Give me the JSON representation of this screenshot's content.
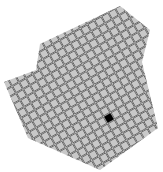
{
  "caption": {
    "text": ""
  },
  "grid": {
    "tile_fill": "#c8c8c8",
    "tile_stroke": "#555555",
    "highlight_fill": "#000000",
    "rotation_deg": -30,
    "pitch_px": 8,
    "tile_px": 7,
    "highlight_center": [
      109,
      118
    ]
  },
  "outline": [
    [
      120,
      6
    ],
    [
      150,
      30
    ],
    [
      142,
      62
    ],
    [
      158,
      128
    ],
    [
      100,
      170
    ],
    [
      28,
      138
    ],
    [
      4,
      82
    ],
    [
      36,
      70
    ],
    [
      40,
      44
    ]
  ]
}
